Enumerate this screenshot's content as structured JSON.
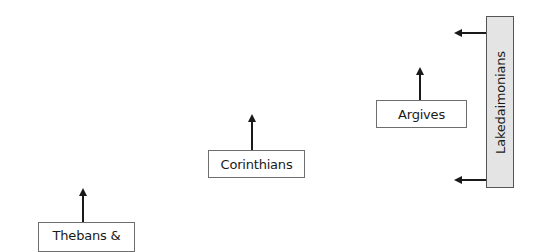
{
  "diagram": {
    "nodes": [
      {
        "id": "thebans",
        "label": "Thebans &"
      },
      {
        "id": "corinthians",
        "label": "Corinthians"
      },
      {
        "id": "argives",
        "label": "Argives"
      },
      {
        "id": "lakedaimonians",
        "label": "Lakedaimonians"
      }
    ],
    "arrows": [
      {
        "from": "thebans",
        "direction": "up"
      },
      {
        "from": "corinthians",
        "direction": "up"
      },
      {
        "from": "argives",
        "direction": "up"
      },
      {
        "from": "lakedaimonians",
        "direction": "left",
        "position": "top"
      },
      {
        "from": "lakedaimonians",
        "direction": "left",
        "position": "bottom"
      }
    ],
    "colors": {
      "line": "#1a1a1a",
      "box_border": "#6e6e6e",
      "lakedaimonians_fill": "#e4e4e4"
    }
  }
}
